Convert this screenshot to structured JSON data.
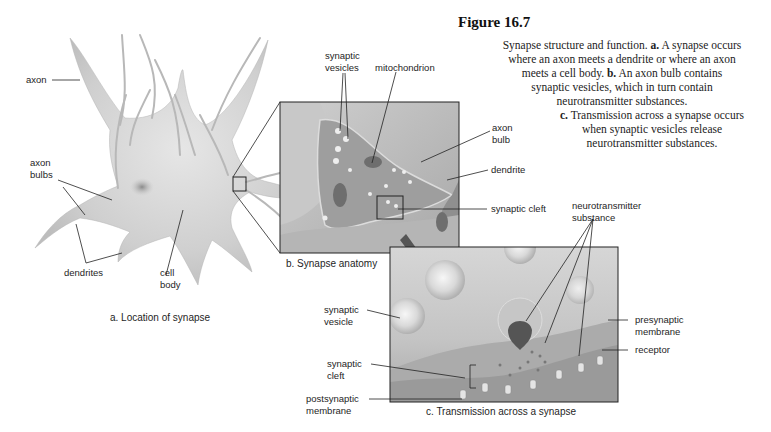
{
  "figure": {
    "title": "Figure 16.7",
    "caption_lines": [
      {
        "pre": "Synapse structure and function. ",
        "bold": "a.",
        "post": " A synapse occurs"
      },
      {
        "pre": "where an axon meets a dendrite or where an axon",
        "bold": "",
        "post": ""
      },
      {
        "pre": "meets a cell body. ",
        "bold": "b.",
        "post": " An axon bulb contains"
      },
      {
        "pre": "synaptic vesicles, which in turn contain",
        "bold": "",
        "post": ""
      },
      {
        "pre": "neurotransmitter substances.",
        "bold": "",
        "post": ""
      },
      {
        "pre": "",
        "bold": "c.",
        "post": " Transmission across a synapse occurs"
      },
      {
        "pre": "when synaptic vesicles release",
        "bold": "",
        "post": ""
      },
      {
        "pre": "neurotransmitter substances.",
        "bold": "",
        "post": ""
      }
    ]
  },
  "panel_a": {
    "caption": "a. Location of synapse",
    "labels": {
      "axon": "axon",
      "axon_bulbs_1": "axon",
      "axon_bulbs_2": "bulbs",
      "dendrites": "dendrites",
      "cell_body_1": "cell",
      "cell_body_2": "body"
    }
  },
  "panel_b": {
    "caption": "b. Synapse anatomy",
    "labels": {
      "synaptic_vesicles_1": "synaptic",
      "synaptic_vesicles_2": "vesicles",
      "mitochondrion": "mitochondrion",
      "axon_bulb_1": "axon",
      "axon_bulb_2": "bulb",
      "dendrite": "dendrite",
      "synaptic_cleft": "synaptic cleft"
    }
  },
  "panel_c": {
    "caption": "c. Transmission across a synapse",
    "labels": {
      "neurotransmitter_1": "neurotransmitter",
      "neurotransmitter_2": "substance",
      "synaptic_vesicle_1": "synaptic",
      "synaptic_vesicle_2": "vesicle",
      "presynaptic_1": "presynaptic",
      "presynaptic_2": "membrane",
      "receptor": "receptor",
      "synaptic_cleft_1": "synaptic",
      "synaptic_cleft_2": "cleft",
      "postsynaptic_1": "postsynaptic",
      "postsynaptic_2": "membrane"
    }
  }
}
